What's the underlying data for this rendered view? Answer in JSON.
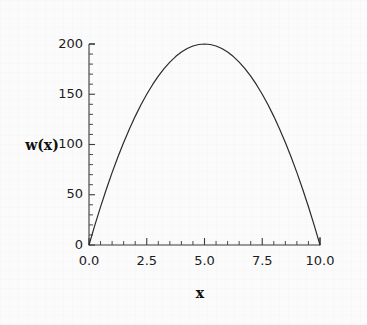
{
  "figure": {
    "background_color": "#fbfbfb",
    "curve_color": "#2b2b2b",
    "axis_color": "#3a3a3a"
  },
  "chart_data": {
    "type": "line",
    "title": "",
    "subtitle": "",
    "xlabel": "x",
    "ylabel": "w(x)",
    "xlim": [
      0,
      10
    ],
    "ylim": [
      0,
      200
    ],
    "grid": false,
    "legend": null,
    "x_ticks": [
      0.0,
      2.5,
      5.0,
      7.5,
      10.0
    ],
    "x_tick_labels": [
      "0.0",
      "2.5",
      "5.0",
      "7.5",
      "10.0"
    ],
    "x_minor_step": 0.5,
    "y_ticks": [
      0,
      50,
      100,
      150,
      200
    ],
    "y_tick_labels": [
      "0",
      "50",
      "100",
      "150",
      "200"
    ],
    "y_minor_step": 10,
    "annotations": [],
    "series": [
      {
        "name": "w(x)",
        "expression": "8x(10 - x)",
        "x": [
          0.0,
          0.25,
          0.5,
          0.75,
          1.0,
          1.25,
          1.5,
          1.75,
          2.0,
          2.25,
          2.5,
          2.75,
          3.0,
          3.25,
          3.5,
          3.75,
          4.0,
          4.25,
          4.5,
          4.75,
          5.0,
          5.25,
          5.5,
          5.75,
          6.0,
          6.25,
          6.5,
          6.75,
          7.0,
          7.25,
          7.5,
          7.75,
          8.0,
          8.25,
          8.5,
          8.75,
          9.0,
          9.25,
          9.5,
          9.75,
          10.0
        ],
        "y": [
          0.0,
          19.5,
          38.0,
          55.5,
          72.0,
          87.5,
          102.0,
          115.5,
          128.0,
          139.5,
          150.0,
          159.5,
          168.0,
          175.5,
          182.0,
          187.5,
          192.0,
          195.5,
          198.0,
          199.5,
          200.0,
          199.5,
          198.0,
          195.5,
          192.0,
          187.5,
          182.0,
          175.5,
          168.0,
          159.5,
          150.0,
          139.5,
          128.0,
          115.5,
          102.0,
          87.5,
          72.0,
          55.5,
          38.0,
          19.5,
          0.0
        ]
      }
    ]
  }
}
